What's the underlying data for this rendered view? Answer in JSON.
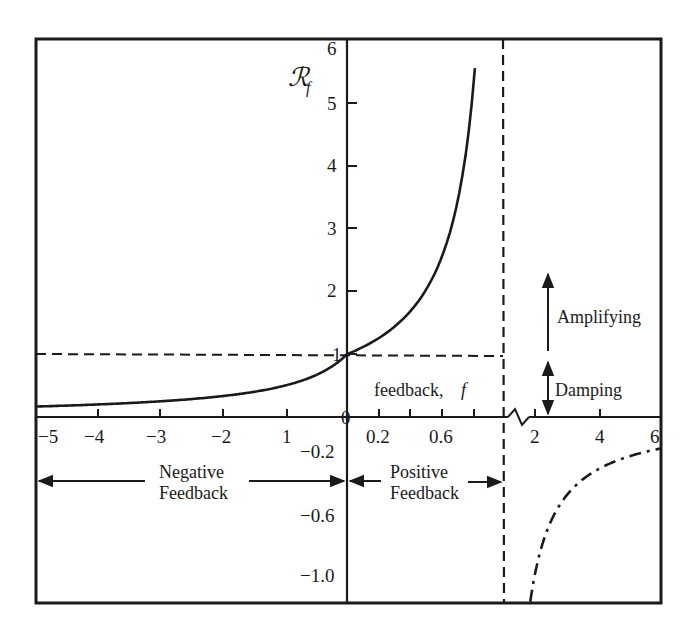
{
  "chart_data": {
    "type": "line",
    "title": "",
    "xlabel": "feedback, f",
    "ylabel": "R_f",
    "ylabel_display": "ℛ",
    "ylabel_sub": "f",
    "formula": "R_f = 1 / (1 - f)",
    "x_axis_segments": [
      {
        "range": [
          -5,
          0
        ],
        "ticks": [
          -5,
          -4,
          -3,
          -2,
          -1,
          0
        ],
        "tick_labels": [
          "−5",
          "−4",
          "−3",
          "−2",
          "1",
          "0"
        ]
      },
      {
        "range": [
          0,
          1
        ],
        "ticks": [
          0.2,
          0.4,
          0.6,
          0.8
        ],
        "tick_labels": [
          "0.2",
          "0.6"
        ]
      },
      {
        "range": [
          1,
          6
        ],
        "axis_break": true,
        "ticks": [
          2,
          4,
          6
        ],
        "tick_labels": [
          "2",
          "4",
          "6"
        ]
      }
    ],
    "y_axis_segments": [
      {
        "range": [
          0,
          6
        ],
        "ticks": [
          1,
          2,
          3,
          4,
          5,
          6
        ],
        "tick_labels": [
          "1",
          "2",
          "3",
          "4",
          "5",
          "6"
        ]
      },
      {
        "range": [
          -1.2,
          0
        ],
        "ticks": [
          -0.2,
          -0.6,
          -1.0
        ],
        "tick_labels": [
          "−0.2",
          "−0.6",
          "−1.0"
        ]
      }
    ],
    "series": [
      {
        "name": "R_f for f < 1 (solid)",
        "style": "solid",
        "x": [
          -5,
          -4,
          -3,
          -2,
          -1,
          -0.5,
          0,
          0.2,
          0.4,
          0.6,
          0.7,
          0.8,
          0.833
        ],
        "values": [
          0.167,
          0.2,
          0.25,
          0.333,
          0.5,
          0.667,
          1.0,
          1.25,
          1.667,
          2.5,
          3.333,
          5.0,
          6.0
        ]
      },
      {
        "name": "R_f for f > 1 (dash-dot)",
        "style": "dash-dot",
        "x": [
          1.85,
          2,
          2.5,
          3,
          4,
          5,
          6
        ],
        "values": [
          -1.18,
          -1.0,
          -0.667,
          -0.5,
          -0.333,
          -0.25,
          -0.2
        ]
      }
    ],
    "reference_lines": [
      {
        "type": "horizontal",
        "y": 1,
        "x_range": [
          -5,
          1
        ],
        "style": "dashed"
      },
      {
        "type": "vertical",
        "x": 1,
        "style": "dashed",
        "meaning": "asymptote f = 1"
      }
    ],
    "annotations": [
      {
        "text": "Amplifying",
        "arrow": "up",
        "y_range": [
          1,
          2.3
        ]
      },
      {
        "text": "Damping",
        "arrow": "both",
        "y_range": [
          0,
          1
        ]
      },
      {
        "text": "Negative Feedback",
        "arrow": "both",
        "x_range": [
          -5,
          0
        ],
        "y": -0.4
      },
      {
        "text": "Positive Feedback",
        "arrow": "both",
        "x_range": [
          0,
          1
        ],
        "y": -0.4
      }
    ],
    "grid": false,
    "legend": null
  },
  "labels": {
    "ylabel_main": "ℛ",
    "ylabel_sub": "f",
    "xlabel": "feedback,",
    "xlabel_var": "f",
    "amplifying": "Amplifying",
    "damping": "Damping",
    "negative_line1": "Negative",
    "negative_line2": "Feedback",
    "positive_line1": "Positive",
    "positive_line2": "Feedback",
    "y_pos": [
      "1",
      "2",
      "3",
      "4",
      "5",
      "6"
    ],
    "y_neg": [
      "−0.2",
      "−0.6",
      "−1.0"
    ],
    "x_left": [
      "−5",
      "−4",
      "−3",
      "−2",
      "1"
    ],
    "x_zero": "0",
    "x_mid": [
      "0.2",
      "0.6"
    ],
    "x_right": [
      "2",
      "4",
      "6"
    ]
  },
  "colors": {
    "ink": "#1a1a1a",
    "background": "#ffffff"
  }
}
